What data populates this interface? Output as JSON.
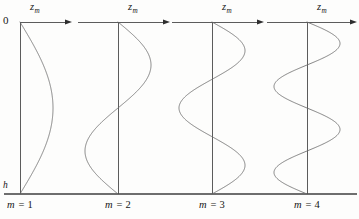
{
  "figure": {
    "background_color": "#fdfdfc",
    "curve_color": "#6a6a6a",
    "axis_color": "#4a4a4a",
    "baseline_color": "#6e6e6e",
    "text_color": "#161616",
    "width": 359,
    "height": 219,
    "top_axis_y": 22,
    "baseline_y": 194,
    "baseline_x_start": 4,
    "baseline_x_end": 357
  },
  "labels": {
    "surface_depth": "0",
    "bottom_depth": "h",
    "axis_symbol": "z",
    "axis_subscript": "m"
  },
  "panels": [
    {
      "id": "panel-m1",
      "caption_symbol": "m",
      "caption_equals": "= 1",
      "caption_full": "m = 1",
      "mode_number": 1,
      "axis_x": 20,
      "axis_top_y": 22,
      "axis_bottom_y": 194,
      "axis_hline_x_start": 20,
      "axis_hline_x_end": 72,
      "amplitude": 33,
      "lobe_direction": 1,
      "caption_x": 20,
      "caption_y": 200,
      "label_x": 30,
      "label_y": 2
    },
    {
      "id": "panel-m2",
      "caption_symbol": "m",
      "caption_equals": "= 2",
      "caption_full": "m = 2",
      "mode_number": 2,
      "axis_x": 118,
      "axis_top_y": 22,
      "axis_bottom_y": 194,
      "axis_hline_x_start": 78,
      "axis_hline_x_end": 170,
      "amplitude": 33,
      "lobe_direction": 1,
      "caption_x": 118,
      "caption_y": 200,
      "label_x": 128,
      "label_y": 2
    },
    {
      "id": "panel-m3",
      "caption_symbol": "m",
      "caption_equals": "= 3",
      "caption_full": "m = 3",
      "mode_number": 3,
      "axis_x": 212,
      "axis_top_y": 22,
      "axis_bottom_y": 194,
      "axis_hline_x_start": 172,
      "axis_hline_x_end": 264,
      "amplitude": 33,
      "lobe_direction": 1,
      "caption_x": 212,
      "caption_y": 200,
      "label_x": 222,
      "label_y": 2
    },
    {
      "id": "panel-m4",
      "caption_symbol": "m",
      "caption_equals": "= 4",
      "caption_full": "m = 4",
      "mode_number": 4,
      "axis_x": 307,
      "axis_top_y": 22,
      "axis_bottom_y": 194,
      "axis_hline_x_start": 267,
      "axis_hline_x_end": 357,
      "amplitude": 33,
      "lobe_direction": 1,
      "caption_x": 307,
      "caption_y": 200,
      "label_x": 317,
      "label_y": 2
    }
  ],
  "chart_data": {
    "type": "line",
    "title": "",
    "xlabel": "z_m",
    "ylabel": "depth",
    "ylim": [
      0,
      1
    ],
    "y_tick_labels": [
      "0",
      "h"
    ],
    "grid": false,
    "legend": false,
    "depth_axis_direction": "downward",
    "series": [
      {
        "name": "m = 1",
        "formula": "sin(1*pi*z/h)",
        "zero_crossings_interior": 0,
        "extrema": 1,
        "amplitude": 1
      },
      {
        "name": "m = 2",
        "formula": "sin(2*pi*z/h)",
        "zero_crossings_interior": 1,
        "extrema": 2,
        "amplitude": 1
      },
      {
        "name": "m = 3",
        "formula": "sin(3*pi*z/h)",
        "zero_crossings_interior": 2,
        "extrema": 3,
        "amplitude": 1
      },
      {
        "name": "m = 4",
        "formula": "sin(4*pi*z/h)",
        "zero_crossings_interior": 3,
        "extrema": 4,
        "amplitude": 1
      }
    ]
  }
}
